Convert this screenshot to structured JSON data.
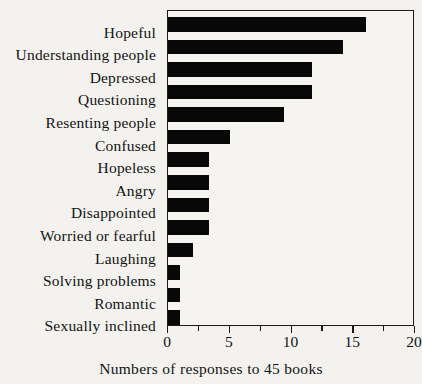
{
  "chart_data": {
    "type": "bar",
    "orientation": "horizontal",
    "title": "",
    "xlabel": "Numbers of responses to 45 books",
    "ylabel": "",
    "xlim": [
      0,
      20
    ],
    "xticks": [
      0,
      5,
      10,
      15,
      20
    ],
    "xtick_labels": [
      "0",
      "5",
      "10",
      "15",
      "20"
    ],
    "minor_tick_step": 2.5,
    "grid": false,
    "legend": null,
    "bar_color": "#080808",
    "frame_color": "#1a1a1a",
    "background_color": "#f3f2ef",
    "categories": [
      "Hopeful",
      "Understanding people",
      "Depressed",
      "Questioning",
      "Resenting people",
      "Confused",
      "Hopeless",
      "Angry",
      "Disappointed",
      "Worried or fearful",
      "Laughing",
      "Solving problems",
      "Romantic",
      "Sexually inclined"
    ],
    "values": [
      16,
      14.2,
      11.7,
      11.7,
      9.4,
      5,
      3.3,
      3.3,
      3.3,
      3.3,
      2,
      1,
      1,
      1
    ]
  }
}
